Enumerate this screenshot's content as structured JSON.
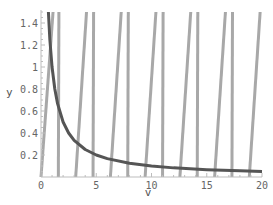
{
  "chart_data": {
    "type": "line",
    "title": "",
    "xlabel": "v",
    "ylabel": "y",
    "xlim": [
      0,
      20
    ],
    "ylim": [
      0,
      1.5
    ],
    "grid": false,
    "legend": null,
    "x_ticks": [
      0,
      5,
      10,
      15,
      20
    ],
    "x_tick_labels": [
      "0",
      "5",
      "10",
      "15",
      "20"
    ],
    "y_ticks": [
      0.2,
      0.4,
      0.6,
      0.8,
      1,
      1.2,
      1.4
    ],
    "y_tick_labels": [
      "0.2",
      "0.4",
      "0.6",
      "0.8",
      "1",
      "1.2",
      "1.4"
    ],
    "origin_label": "0",
    "series": [
      {
        "name": "y = 1/v",
        "color": "#555555",
        "width": 3,
        "x": [
          0.67,
          0.8,
          1,
          1.25,
          1.5,
          2,
          2.5,
          3,
          4,
          5,
          6,
          8,
          10,
          12,
          15,
          18,
          20
        ],
        "y": [
          1.5,
          1.25,
          1.0,
          0.8,
          0.667,
          0.5,
          0.4,
          0.333,
          0.25,
          0.2,
          0.167,
          0.125,
          0.1,
          0.083,
          0.067,
          0.056,
          0.05
        ]
      },
      {
        "name": "tan-like branches",
        "color": "#a8a8a8",
        "width": 3,
        "segments": [
          {
            "x": [
              0.0,
              1.09
            ],
            "y": [
              0,
              1.5
            ]
          },
          {
            "x": [
              3.14,
              4.12
            ],
            "y": [
              0,
              1.5
            ]
          },
          {
            "x": [
              6.28,
              7.26
            ],
            "y": [
              0,
              1.5
            ]
          },
          {
            "x": [
              9.42,
              10.4
            ],
            "y": [
              0,
              1.5
            ]
          },
          {
            "x": [
              12.57,
              13.55
            ],
            "y": [
              0,
              1.5
            ]
          },
          {
            "x": [
              15.71,
              16.69
            ],
            "y": [
              0,
              1.5
            ]
          },
          {
            "x": [
              18.85,
              19.83
            ],
            "y": [
              0,
              1.5
            ]
          }
        ]
      },
      {
        "name": "near-vertical branches",
        "color": "#a8a8a8",
        "width": 3,
        "segments": [
          {
            "x": [
              1.57,
              1.62
            ],
            "y": [
              0,
              1.5
            ]
          },
          {
            "x": [
              4.71,
              4.76
            ],
            "y": [
              0,
              1.5
            ]
          },
          {
            "x": [
              7.85,
              7.9
            ],
            "y": [
              0,
              1.5
            ]
          },
          {
            "x": [
              11.0,
              11.05
            ],
            "y": [
              0,
              1.5
            ]
          },
          {
            "x": [
              14.14,
              14.19
            ],
            "y": [
              0,
              1.5
            ]
          },
          {
            "x": [
              17.28,
              17.33
            ],
            "y": [
              0,
              1.5
            ]
          }
        ]
      }
    ]
  },
  "colors": {
    "axis": "#bdbdbd",
    "tick_text": "#666666",
    "curve": "#555555",
    "lines": "#a8a8a8"
  },
  "layout": {
    "origin_px": [
      41,
      177
    ],
    "px_per_x": 11.05,
    "px_per_y": 110
  }
}
